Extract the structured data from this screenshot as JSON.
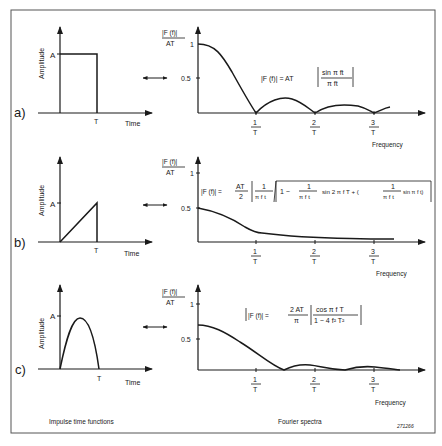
{
  "frame": {
    "border_color": "#555555"
  },
  "panels": [
    {
      "id": "a",
      "label": "a)",
      "time_plot": {
        "ylabel": "Amplitude",
        "amp_label": "A",
        "t_label": "T",
        "xlabel": "Time",
        "shape": "rectangular"
      },
      "arrow": "↔",
      "spectrum": {
        "ylabel_num": "|F (f)|",
        "ylabel_den": "AT",
        "ticks_y": [
          "1",
          "0.5"
        ],
        "ticks_x": [
          {
            "num": "1",
            "den": "T"
          },
          {
            "num": "2",
            "den": "T"
          },
          {
            "num": "3",
            "den": "T"
          }
        ],
        "xlabel": "Frequency",
        "formula": {
          "lhs": "|F (f)| = AT",
          "num": "sin π ft",
          "den": "π ft"
        }
      }
    },
    {
      "id": "b",
      "label": "b)",
      "time_plot": {
        "ylabel": "Amplitude",
        "amp_label": "A",
        "t_label": "T",
        "xlabel": "Time",
        "shape": "ramp"
      },
      "arrow": "↔",
      "spectrum": {
        "ylabel_num": "|F (f)|",
        "ylabel_den": "AT",
        "ticks_y": [
          "1",
          "0.5"
        ],
        "ticks_x": [
          {
            "num": "1",
            "den": "T"
          },
          {
            "num": "2",
            "den": "T"
          },
          {
            "num": "3",
            "den": "T"
          }
        ],
        "xlabel": "Frequency",
        "formula": {
          "lhs": "|F (f)| =",
          "coef_num": "AT",
          "coef_den": "2",
          "f1_num": "1",
          "f1_den": "π f t",
          "root_a": "1 −",
          "f2_num": "1",
          "f2_den": "π f t",
          "root_b": "sin 2 π f T + (",
          "f3_num": "1",
          "f3_den": "π f t",
          "root_c": "sin π f t)"
        }
      }
    },
    {
      "id": "c",
      "label": "c)",
      "time_plot": {
        "ylabel": "Amplitude",
        "amp_label": "A",
        "t_label": "T",
        "xlabel": "Time",
        "shape": "half-sine"
      },
      "arrow": "↔",
      "spectrum": {
        "ylabel_num": "|F (f)|",
        "ylabel_den": "AT",
        "ticks_y": [
          "1",
          "0.5"
        ],
        "ticks_x": [
          {
            "num": "1",
            "den": "T"
          },
          {
            "num": "2",
            "den": "T"
          },
          {
            "num": "3",
            "den": "T"
          }
        ],
        "xlabel": "Frequency",
        "formula": {
          "lhs": "|F (f)| =",
          "coef_num": "2 AT",
          "coef_den": "π",
          "num": "cos π f T",
          "den": "1 − 4 f² T²"
        }
      }
    }
  ],
  "captions": {
    "left": "Impulse time functions",
    "right": "Fourier spectra",
    "ref": "271266"
  }
}
